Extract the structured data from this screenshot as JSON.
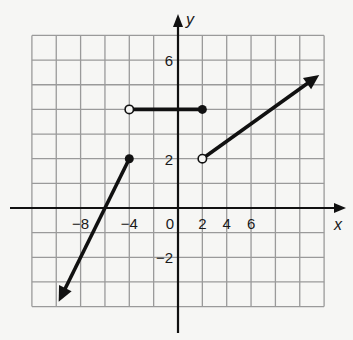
{
  "chart_data": {
    "type": "line",
    "title": "",
    "xlabel": "x",
    "ylabel": "y",
    "grid": true,
    "xlim": [
      -12,
      12
    ],
    "ylim": [
      -4,
      7
    ],
    "x_units_per_grid": 2,
    "y_units_per_grid": 1,
    "x_tick_labels": [
      {
        "value": -8,
        "label": "−8"
      },
      {
        "value": -4,
        "label": "−4"
      },
      {
        "value": 0,
        "label": "0"
      },
      {
        "value": 2,
        "label": "2"
      },
      {
        "value": 4,
        "label": "4"
      },
      {
        "value": 6,
        "label": "6"
      }
    ],
    "y_tick_labels": [
      {
        "value": 6,
        "label": "6"
      },
      {
        "value": 2,
        "label": "2"
      },
      {
        "value": -2,
        "label": "−2"
      }
    ],
    "series": [
      {
        "name": "ray-left",
        "kind": "ray",
        "start": {
          "x": -4,
          "y": 2,
          "endpoint": "closed"
        },
        "end": {
          "x": -9.8,
          "y": -3.8,
          "endpoint": "arrow"
        }
      },
      {
        "name": "horizontal-segment",
        "kind": "segment",
        "start": {
          "x": -4,
          "y": 4,
          "endpoint": "open"
        },
        "end": {
          "x": 2,
          "y": 4,
          "endpoint": "closed"
        }
      },
      {
        "name": "ray-right",
        "kind": "ray",
        "start": {
          "x": 2,
          "y": 2,
          "endpoint": "open"
        },
        "end": {
          "x": 11.6,
          "y": 5.4,
          "endpoint": "arrow"
        }
      }
    ],
    "colors": {
      "background": "#f6f6f4",
      "grid": "#9a9a9a",
      "axis": "#111111",
      "curve": "#111111"
    }
  }
}
